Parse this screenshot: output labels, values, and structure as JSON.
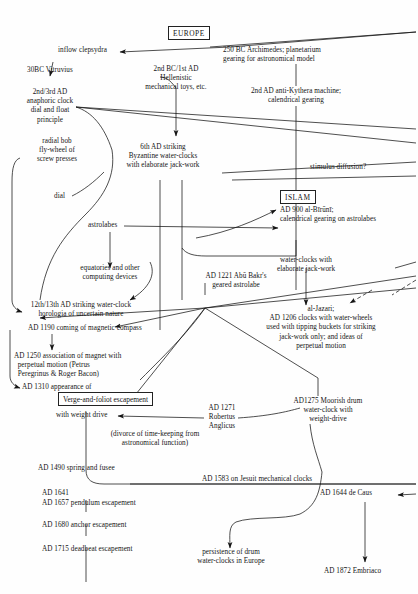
{
  "diagram": {
    "type": "flow-diagram",
    "ink_color": "#141414",
    "regions": [
      {
        "id": "europe",
        "label": "EUROPE"
      },
      {
        "id": "islam",
        "label": "ISLAM"
      }
    ]
  },
  "nodes": {
    "europe_box": "EUROPE",
    "islam_box": "ISLAM",
    "verge_box": "Verge-and-foliot escapement",
    "inflow_clepsydra": "inflow clepsydra",
    "vitruvius": "30BC Vitruvius",
    "anaphoric_clock": "2nd/3rd AD\nanaphoric clock\ndial and float\nprinciple",
    "archimedes": "250 BC Archimedes; planetarium\ngearing for astronomical model",
    "hellenistic": "2nd BC/1st AD\nHellenistic\nmechanical toys, etc.",
    "antikythera": "2nd AD anti-Kythera machine;\ncalendrical gearing",
    "radial_bob": "radial bob\nfly-wheel of\nscrew presses",
    "byzantine": "6th AD striking\nByzantine water-clocks\nwith elaborate jack-work",
    "stimulus_diffusion": "stimulus diffusion?",
    "dial": "dial",
    "astrolabes": "astrolabes",
    "al_biruni": "AD 900 al-Bīrūnī;\ncalendrical gearing on astrolabes",
    "equatories": "equatories and other\ncomputing devices",
    "abu_bakr": "AD 1221 Abū Bakr's\ngeared astrolabe",
    "water_clocks_jackwork": "water-clocks with\nelaborate jack-work",
    "horologia": "12th/13th AD striking water-clock\nhorologia of uncertain nature",
    "magnetic_compass": "AD 1190 coming of magnetic compass",
    "al_jazari": "al-Jazari;\nAD 1206 clocks with water-wheels\nused with tipping buckets for striking\njack-work only; and ideas of\nperpetual motion",
    "magnet_perpetual": "AD 1250 association of magnet with\n  perpetual motion (Petrus\n  Peregrinus & Roger Bacon)",
    "ad1310": "AD 1310 appearance of",
    "with_weight_drive": "with weight drive",
    "robertus": "AD 1271\nRobertus\nAnglicus",
    "moorish_drum": "AD1275 Moorish drum\nwater-clock with\nweight-drive",
    "divorce": "(divorce of time-keeping from\nastronomical function)",
    "spring_fusee": "AD 1490 spring and fusee",
    "jesuit": "AD 1583 on Jesuit mechanical clocks",
    "ad1641": "AD 1641",
    "pendulum": "AD 1657 pendulum escapement",
    "de_caus": "AD 1644 de Caus",
    "anchor": "AD 1680 anchor escapement",
    "persistence": "persistence of drum\nwater-clocks in Europe",
    "deadbeat": "AD 1715 deadbeat escapement",
    "embriaco": "AD 1872 Embriaco"
  }
}
